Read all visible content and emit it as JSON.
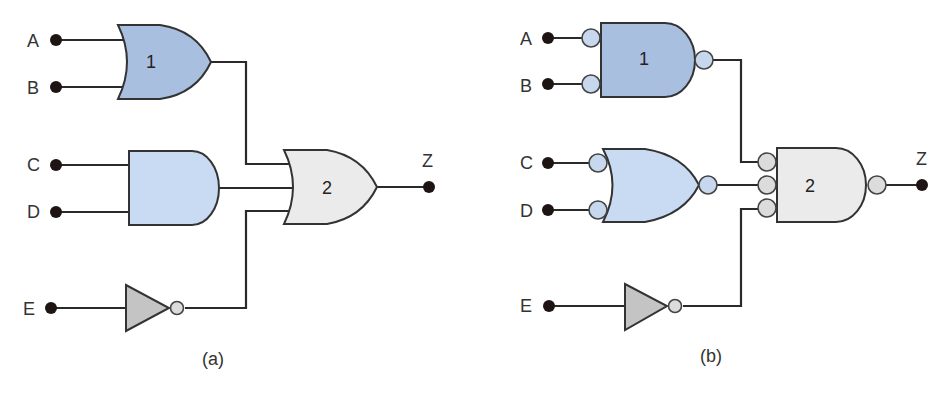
{
  "colors": {
    "gate1_fill": "#a9bfe0",
    "gate_and_c_d_fill": "#c9dbf2",
    "gate2_fill": "#ebebeb",
    "inverter_fill": "#c4c4c4",
    "bubble_blue": "#c7d8ee",
    "bubble_gray": "#dcdcdc",
    "terminal": "#1e1414",
    "wire": "#2a2a2a"
  },
  "diagram_a": {
    "caption": "(a)",
    "inputs": [
      "A",
      "B",
      "C",
      "D",
      "E"
    ],
    "output": "Z",
    "gate1_label": "1",
    "gate2_label": "2",
    "gates": [
      {
        "id": "1",
        "type": "OR",
        "inputs": [
          "A",
          "B"
        ]
      },
      {
        "id": "and",
        "type": "AND",
        "inputs": [
          "C",
          "D"
        ]
      },
      {
        "id": "inv",
        "type": "NOT",
        "inputs": [
          "E"
        ]
      },
      {
        "id": "2",
        "type": "OR",
        "inputs": [
          "gate1",
          "and",
          "inv"
        ],
        "output": "Z"
      }
    ]
  },
  "diagram_b": {
    "caption": "(b)",
    "inputs": [
      "A",
      "B",
      "C",
      "D",
      "E"
    ],
    "output": "Z",
    "gate1_label": "1",
    "gate2_label": "2",
    "gates": [
      {
        "id": "1",
        "type": "AND with inverted inputs and inverted output",
        "inputs": [
          "A",
          "B"
        ]
      },
      {
        "id": "or",
        "type": "OR with inverted inputs and inverted output",
        "inputs": [
          "C",
          "D"
        ]
      },
      {
        "id": "inv",
        "type": "NOT",
        "inputs": [
          "E"
        ]
      },
      {
        "id": "2",
        "type": "AND with inverted inputs and inverted output",
        "inputs": [
          "gate1",
          "or",
          "inv"
        ],
        "output": "Z"
      }
    ]
  }
}
